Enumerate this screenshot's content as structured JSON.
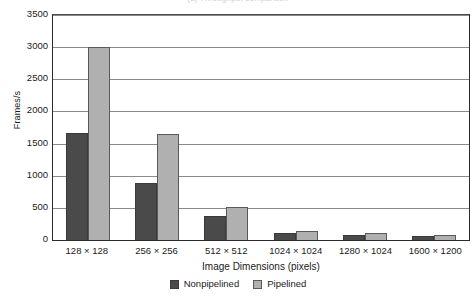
{
  "clipped_title": "(a) Throughput comparison",
  "chart_data": {
    "type": "bar",
    "title": "",
    "xlabel": "Image Dimensions (pixels)",
    "ylabel": "Frames/s",
    "categories": [
      "128 × 128",
      "256 × 256",
      "512 × 512",
      "1024 × 1024",
      "1280 × 1024",
      "1600 × 1200"
    ],
    "series": [
      {
        "name": "Nonpipelined",
        "color": "#4a4a4a",
        "values": [
          1660,
          890,
          380,
          115,
          85,
          55
        ]
      },
      {
        "name": "Pipelined",
        "color": "#b0b0b0",
        "values": [
          3010,
          1650,
          510,
          145,
          115,
          85
        ]
      }
    ],
    "ylim": [
      0,
      3500
    ],
    "ytick_step": 500,
    "yticks": [
      0,
      500,
      1000,
      1500,
      2000,
      2500,
      3000,
      3500
    ],
    "ytick_labels": [
      "0",
      "500",
      "1000",
      "1500",
      "2000",
      "2500",
      "3000",
      "3500"
    ],
    "grid": true,
    "grid_axis": "y",
    "legend_position": "bottom-center"
  }
}
